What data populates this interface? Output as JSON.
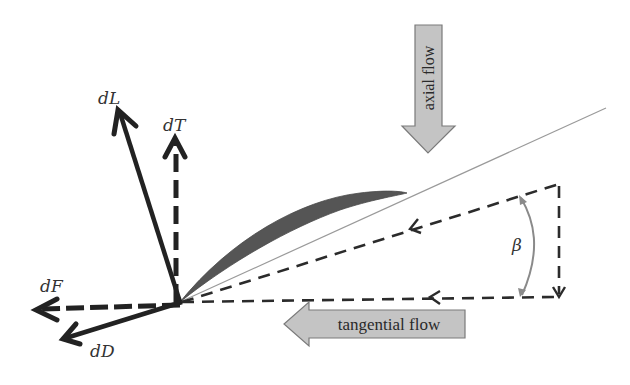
{
  "diagram": {
    "colors": {
      "background": "#ffffff",
      "force_arrows": "#222222",
      "dashed_lines": "#2b2b2b",
      "airfoil": "#555555",
      "chord_line": "#9a9a9a",
      "flow_arrow_fill": "#c4c4c4",
      "flow_arrow_stroke": "#7a7a7a",
      "angle_arc": "#8a8a8a"
    },
    "forces": {
      "lift": {
        "label": "dL",
        "style": "solid"
      },
      "thrust": {
        "label": "dT",
        "style": "dashed"
      },
      "tangential_force": {
        "label": "dF",
        "style": "dashed"
      },
      "drag": {
        "label": "dD",
        "style": "solid"
      }
    },
    "flows": {
      "axial": {
        "label": "axial flow",
        "direction": "down"
      },
      "tangential": {
        "label": "tangential flow",
        "direction": "left"
      }
    },
    "angle": {
      "label": "β"
    }
  }
}
